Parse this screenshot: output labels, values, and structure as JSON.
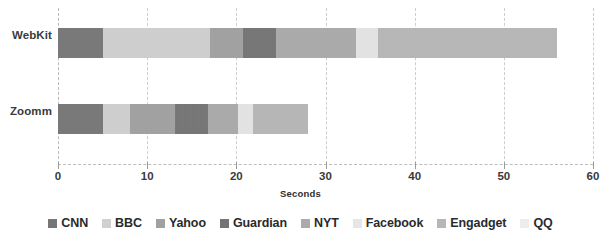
{
  "chart_data": {
    "type": "bar",
    "orientation": "horizontal",
    "stacked": true,
    "title": "",
    "xlabel": "Seconds",
    "ylabel": "",
    "xlim": [
      0,
      60
    ],
    "xticks": [
      0,
      10,
      20,
      30,
      40,
      50,
      60
    ],
    "xtick_labels": [
      "0",
      "10",
      "20",
      "30",
      "40",
      "50",
      "60"
    ],
    "grid": true,
    "grid_axis": "x",
    "legend_position": "bottom",
    "categories": [
      "WebKit",
      "Zoomm"
    ],
    "series": [
      {
        "name": "CNN",
        "color": "#6e6e6e",
        "values": [
          5.0,
          5.0
        ]
      },
      {
        "name": "BBC",
        "color": "#d2d2d2",
        "values": [
          12.0,
          3.1
        ]
      },
      {
        "name": "Yahoo",
        "color": "#9d9d9d",
        "values": [
          3.7,
          5.0
        ]
      },
      {
        "name": "Guardian",
        "color": "#6b6b6b",
        "values": [
          3.7,
          3.7
        ]
      },
      {
        "name": "NYT",
        "color": "#a8a8a8",
        "values": [
          9.0,
          3.4
        ]
      },
      {
        "name": "Facebook",
        "color": "#eaeaea",
        "values": [
          2.5,
          1.7
        ]
      },
      {
        "name": "Engadget",
        "color": "#b6b6b6",
        "values": [
          20.1,
          6.1
        ]
      },
      {
        "name": "QQ",
        "color": "#f2f2f2",
        "values": [
          0.0,
          0.0
        ]
      }
    ],
    "totals": [
      56.0,
      28.0
    ]
  },
  "axis": {
    "x_title": "Seconds"
  },
  "legend": {
    "items": [
      {
        "label": "CNN"
      },
      {
        "label": "BBC"
      },
      {
        "label": "Yahoo"
      },
      {
        "label": "Guardian"
      },
      {
        "label": "NYT"
      },
      {
        "label": "Facebook"
      },
      {
        "label": "Engadget"
      },
      {
        "label": "QQ"
      }
    ]
  }
}
